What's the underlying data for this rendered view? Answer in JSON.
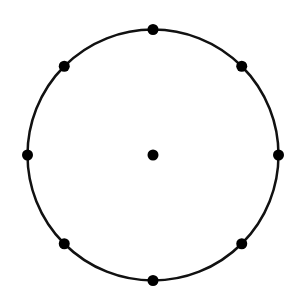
{
  "diagram": {
    "type": "circle-with-points",
    "stroke_color": "#111111",
    "point_color": "#000000",
    "background_color": "#ffffff",
    "circumference_points": 8,
    "point_angles_deg": [
      90,
      45,
      0,
      315,
      270,
      225,
      180,
      135
    ],
    "has_center_point": true
  }
}
